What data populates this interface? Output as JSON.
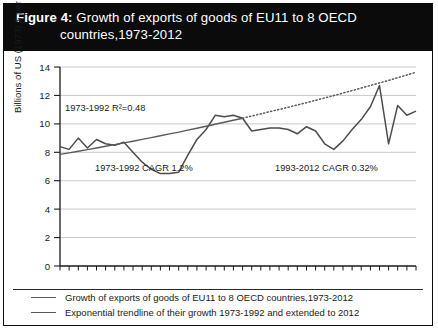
{
  "figure": {
    "label": "Figure 4:",
    "title_line1": "Growth of exports of goods of EU11 to 8 OECD",
    "title_line2": "countries,1973-2012"
  },
  "axes": {
    "ylabel": "Billions of US (1973) $ per month",
    "yticks": [
      "0",
      "2",
      "4",
      "6",
      "8",
      "10",
      "12",
      "14"
    ],
    "xticks": [
      "1975",
      "1980",
      "1985",
      "1990",
      "1995",
      "2000",
      "2005",
      "2010"
    ]
  },
  "annotations": {
    "r_squared": "1973-1992 R²=0.48",
    "cagr_early": "1973-1992 CAGR 1.2%",
    "cagr_late": "1993-2012 CAGR 0.32%"
  },
  "legend": {
    "items": [
      "Growth of exports of goods of EU11 to 8 OECD countries,1973-2012",
      "Exponential trendline of their growth 1973-1992 and extended to 2012"
    ]
  },
  "colors": {
    "band": "#0b0b0b",
    "series": "#4c4c4c",
    "trend": "#5a5a5a",
    "grid": "#c9c9c9",
    "axis": "#1b1b1b"
  },
  "chart_data": {
    "type": "line",
    "title": "Growth of exports of goods of EU11 to 8 OECD countries,1973-2012",
    "xlabel": "",
    "ylabel": "Billions of US (1973) $ per month",
    "xlim": [
      1973,
      2012
    ],
    "ylim": [
      0,
      14
    ],
    "grid": true,
    "legend_position": "below",
    "x": [
      1973,
      1974,
      1975,
      1976,
      1977,
      1978,
      1979,
      1980,
      1981,
      1982,
      1983,
      1984,
      1985,
      1986,
      1987,
      1988,
      1989,
      1990,
      1991,
      1992,
      1993,
      1994,
      1995,
      1996,
      1997,
      1998,
      1999,
      2000,
      2001,
      2002,
      2003,
      2004,
      2005,
      2006,
      2007,
      2008,
      2009,
      2010,
      2011,
      2012
    ],
    "series": [
      {
        "name": "Growth of exports of goods of EU11 to 8 OECD countries,1973-2012",
        "style": "solid",
        "values": [
          8.4,
          8.2,
          9.0,
          8.3,
          8.9,
          8.6,
          8.5,
          8.7,
          8.0,
          7.3,
          6.8,
          6.5,
          6.5,
          6.6,
          7.8,
          8.9,
          9.6,
          10.6,
          10.5,
          10.6,
          10.4,
          9.5,
          9.6,
          9.7,
          9.7,
          9.6,
          9.3,
          9.8,
          9.5,
          8.6,
          8.2,
          8.8,
          9.6,
          10.3,
          11.2,
          12.7,
          8.6,
          11.3,
          10.6,
          10.9
        ]
      },
      {
        "name": "Exponential trendline of their growth 1973-1992 and extended to 2012",
        "style": "solid-then-dotted",
        "dotted_from": 1993,
        "values": [
          7.85,
          7.96,
          8.07,
          8.19,
          8.3,
          8.42,
          8.54,
          8.66,
          8.78,
          8.91,
          9.03,
          9.16,
          9.29,
          9.42,
          9.56,
          9.69,
          9.83,
          9.97,
          10.11,
          10.26,
          10.4,
          10.55,
          10.7,
          10.86,
          11.01,
          11.17,
          11.33,
          11.49,
          11.66,
          11.82,
          11.99,
          12.17,
          12.34,
          12.52,
          12.7,
          12.88,
          13.06,
          13.25,
          13.44,
          13.63
        ]
      }
    ],
    "annotations": [
      {
        "text": "1973-1992 R²=0.48",
        "x": 1974,
        "y": 11.0
      },
      {
        "text": "1973-1992 CAGR 1.2%",
        "x": 1980,
        "y": 6.6
      },
      {
        "text": "1993-2012 CAGR 0.32%",
        "x": 2000,
        "y": 6.6
      }
    ]
  }
}
